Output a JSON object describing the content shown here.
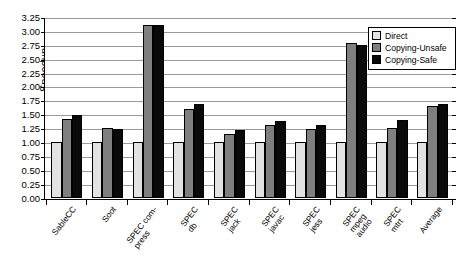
{
  "chart_data": {
    "type": "bar",
    "title": "",
    "xlabel": "",
    "ylabel": "Speedup",
    "ylim": [
      0.0,
      3.25
    ],
    "ytick_step": 0.25,
    "ytick_labels": [
      "3.25",
      "3.00",
      "2.75",
      "2.50",
      "2.25",
      "2.00",
      "1.75",
      "1.50",
      "1.25",
      "1.00",
      "0.75",
      "0.50",
      "0.25",
      "0.00"
    ],
    "grid": true,
    "legend_position": "top-right",
    "categories": [
      "SableCC",
      "Soot",
      "SPEC com-\npress",
      "SPEC\ndb",
      "SPEC\njack",
      "SPEC\njavac",
      "SPEC\njess",
      "SPEC\nmpeg\naudio",
      "SPEC\nmtrt",
      "Average"
    ],
    "series": [
      {
        "name": "Direct",
        "color": "#e2e2e2",
        "values": [
          1.0,
          1.0,
          1.0,
          1.0,
          1.0,
          1.0,
          1.0,
          1.0,
          1.0,
          1.0
        ]
      },
      {
        "name": "Copying-Unsafe",
        "color": "#7f7f7f",
        "values": [
          1.42,
          1.26,
          3.1,
          1.6,
          1.14,
          1.3,
          1.23,
          2.78,
          1.26,
          1.65
        ]
      },
      {
        "name": "Copying-Safe",
        "color": "#0a0a0a",
        "values": [
          1.49,
          1.23,
          3.1,
          1.68,
          1.22,
          1.37,
          1.3,
          2.75,
          1.4,
          1.68
        ]
      }
    ]
  },
  "legend": {
    "items": [
      {
        "label": "Direct"
      },
      {
        "label": "Copying-Unsafe"
      },
      {
        "label": "Copying-Safe"
      }
    ]
  }
}
